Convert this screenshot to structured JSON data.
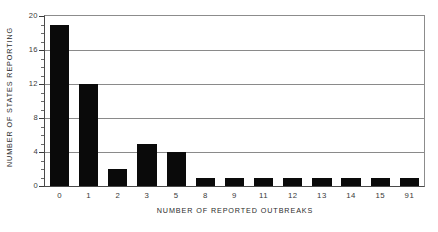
{
  "chart_data": {
    "type": "bar",
    "title": "",
    "xlabel": "NUMBER OF REPORTED OUTBREAKS",
    "ylabel": "NUMBER OF STATES REPORTING",
    "categories": [
      "0",
      "1",
      "2",
      "3",
      "5",
      "8",
      "9",
      "11",
      "12",
      "13",
      "14",
      "15",
      "91"
    ],
    "values": [
      19,
      12,
      2,
      5,
      4,
      1,
      1,
      1,
      1,
      1,
      1,
      1,
      1
    ],
    "ylim": [
      0,
      20
    ],
    "y_ticks": [
      0,
      4,
      8,
      12,
      16,
      20
    ],
    "y_tick_labels": [
      "0",
      "4",
      "8",
      "12",
      "16",
      "20"
    ],
    "y_minor_tick_step": 1,
    "grid": "horizontal",
    "legend": "none",
    "bar_color": "#0a0a0a",
    "grid_color": "#8a8a8a",
    "axis_color": "#4a4a4a",
    "background_color": "#ffffff"
  },
  "axes": {
    "x_title": "NUMBER OF REPORTED OUTBREAKS",
    "y_title": "NUMBER OF STATES REPORTING"
  }
}
